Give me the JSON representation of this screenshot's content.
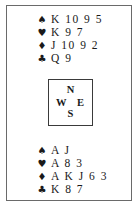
{
  "diagram": {
    "north": {
      "suits": [
        {
          "suit": "spades",
          "symbol": "♠",
          "cards": "K 10 9 5"
        },
        {
          "suit": "hearts",
          "symbol": "♥",
          "cards": "K 9 7"
        },
        {
          "suit": "diamonds",
          "symbol": "♦",
          "cards": "J 10 9 2"
        },
        {
          "suit": "clubs",
          "symbol": "♣",
          "cards": "Q 9"
        }
      ]
    },
    "compass": {
      "north": "N",
      "west": "W",
      "east": "E",
      "south": "S"
    },
    "south": {
      "suits": [
        {
          "suit": "spades",
          "symbol": "♠",
          "cards": "A J"
        },
        {
          "suit": "hearts",
          "symbol": "♥",
          "cards": "A 8 3"
        },
        {
          "suit": "diamonds",
          "symbol": "♦",
          "cards": "A K J 6 3"
        },
        {
          "suit": "clubs",
          "symbol": "♣",
          "cards": "K 8 7"
        }
      ]
    }
  }
}
